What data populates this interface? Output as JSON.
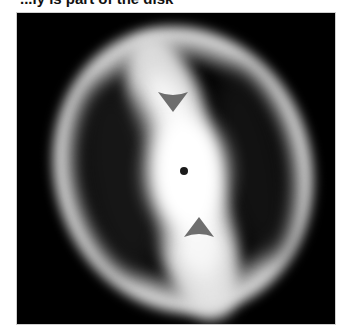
{
  "caption": {
    "text": "...ly is part of the disk"
  },
  "image": {
    "description": "Glowing tilted disk with dark inner lobes, bright central band, central dot and two gray arrowheads pointing toward the center",
    "background_color": "#000000",
    "glow_color": "#f0f0f0",
    "arrow_color": "#6e6e6e",
    "dot_color": "#1a1a1a"
  },
  "markers": {
    "top_arrow": {
      "direction": "down"
    },
    "bottom_arrow": {
      "direction": "up"
    },
    "center": {
      "shape": "dot"
    }
  }
}
